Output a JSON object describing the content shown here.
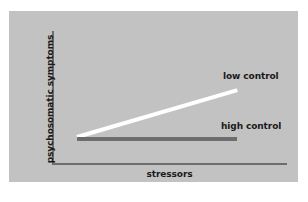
{
  "chart_data": {
    "type": "line",
    "title": "",
    "xlabel": "stressors",
    "ylabel": "psychosomatic symptoms",
    "grid": false,
    "legend_position": "inline-right",
    "axis_ticks": false,
    "xlim": [
      0,
      1
    ],
    "ylim": [
      0,
      1
    ],
    "series": [
      {
        "name": "low control",
        "label": "low control",
        "color": "#ffffff",
        "x": [
          0.12,
          0.8
        ],
        "values": [
          0.2,
          0.57
        ]
      },
      {
        "name": "high control",
        "label": "high control",
        "color": "#6d6d6d",
        "x": [
          0.12,
          0.8
        ],
        "values": [
          0.19,
          0.19
        ]
      }
    ]
  },
  "figure": {
    "background_color": "#ffffff",
    "panel_color": "#c2c2c2",
    "axis_color": "#6d6d6d",
    "text_color": "#1a1a1a"
  }
}
